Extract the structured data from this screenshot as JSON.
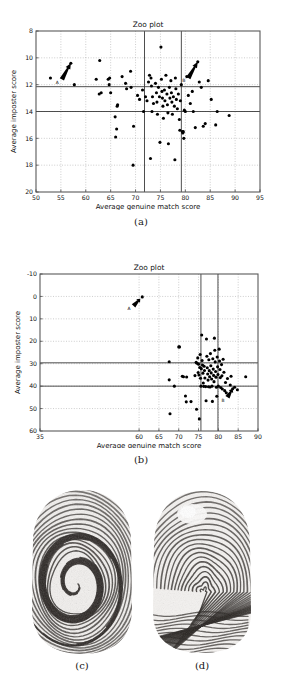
{
  "figure": {
    "panels": [
      {
        "id": "a",
        "caption": "(a)",
        "type": "scatter-zoo-plot"
      },
      {
        "id": "b",
        "caption": "(b)",
        "type": "scatter-zoo-plot"
      },
      {
        "id": "c",
        "caption": "(c)",
        "type": "fingerprint-image",
        "alt": "fingerprint-whorl"
      },
      {
        "id": "d",
        "caption": "(d)",
        "type": "fingerprint-image",
        "alt": "fingerprint-loop"
      }
    ]
  },
  "chart_data": [
    {
      "panel": "a",
      "type": "scatter",
      "title": "Zoo plot",
      "xlabel": "Average genuine match score",
      "ylabel": "Average imposter score",
      "xlim": [
        50,
        95
      ],
      "ylim": [
        8,
        20
      ],
      "y_inverted": true,
      "xticks": [
        50,
        55,
        60,
        65,
        70,
        75,
        80,
        85,
        90,
        95
      ],
      "yticks": [
        8,
        10,
        12,
        14,
        16,
        18,
        20
      ],
      "grid": true,
      "legend": "none",
      "reference_lines": {
        "vertical": [
          71.8,
          79.2
        ],
        "horizontal": [
          12.15,
          14.0
        ]
      },
      "annotations": [
        {
          "label": "A",
          "arrow_from": [
            55.2,
            11.6
          ],
          "arrow_to": [
            57.0,
            10.4
          ]
        },
        {
          "label": "B",
          "arrow_from": [
            80.6,
            11.5
          ],
          "arrow_to": [
            82.5,
            10.3
          ]
        }
      ],
      "points": [
        [
          52.9,
          11.5
        ],
        [
          57.0,
          10.4
        ],
        [
          57.7,
          12.0
        ],
        [
          62.8,
          10.2
        ],
        [
          62.1,
          11.6
        ],
        [
          62.7,
          12.7
        ],
        [
          63.1,
          12.6
        ],
        [
          64.5,
          11.6
        ],
        [
          64.8,
          11.5
        ],
        [
          64.7,
          12.0
        ],
        [
          65.0,
          12.6
        ],
        [
          66.3,
          13.6
        ],
        [
          66.4,
          13.5
        ],
        [
          65.9,
          14.4
        ],
        [
          66.2,
          15.3
        ],
        [
          66.0,
          15.9
        ],
        [
          67.3,
          11.4
        ],
        [
          68.0,
          11.9
        ],
        [
          68.2,
          12.3
        ],
        [
          69.0,
          11.0
        ],
        [
          69.1,
          12.2
        ],
        [
          69.5,
          18.0
        ],
        [
          69.6,
          15.1
        ],
        [
          70.4,
          12.8
        ],
        [
          70.8,
          13.1
        ],
        [
          71.4,
          12.4
        ],
        [
          71.6,
          14.0
        ],
        [
          72.0,
          12.9
        ],
        [
          72.3,
          13.2
        ],
        [
          72.6,
          11.8
        ],
        [
          72.8,
          11.3
        ],
        [
          73.1,
          11.5
        ],
        [
          73.2,
          12.1
        ],
        [
          73.4,
          12.9
        ],
        [
          73.6,
          13.4
        ],
        [
          73.0,
          17.5
        ],
        [
          73.3,
          14.0
        ],
        [
          74.0,
          11.9
        ],
        [
          74.2,
          12.6
        ],
        [
          74.3,
          13.3
        ],
        [
          74.4,
          14.2
        ],
        [
          74.6,
          12.2
        ],
        [
          74.8,
          12.9
        ],
        [
          74.9,
          16.3
        ],
        [
          75.1,
          9.2
        ],
        [
          75.2,
          11.6
        ],
        [
          75.3,
          12.5
        ],
        [
          75.4,
          13.0
        ],
        [
          75.5,
          13.6
        ],
        [
          75.6,
          14.5
        ],
        [
          75.8,
          12.4
        ],
        [
          75.9,
          13.2
        ],
        [
          76.1,
          11.3
        ],
        [
          76.3,
          12.7
        ],
        [
          76.4,
          13.5
        ],
        [
          76.5,
          14.1
        ],
        [
          76.6,
          16.4
        ],
        [
          76.8,
          12.2
        ],
        [
          76.9,
          13.0
        ],
        [
          77.1,
          11.7
        ],
        [
          77.2,
          12.6
        ],
        [
          77.3,
          13.3
        ],
        [
          77.4,
          14.2
        ],
        [
          77.6,
          12.9
        ],
        [
          77.8,
          13.6
        ],
        [
          77.9,
          17.6
        ],
        [
          78.0,
          11.5
        ],
        [
          78.1,
          12.3
        ],
        [
          78.2,
          13.1
        ],
        [
          78.4,
          13.8
        ],
        [
          78.6,
          12.7
        ],
        [
          78.8,
          14.6
        ],
        [
          78.9,
          15.4
        ],
        [
          79.0,
          13.2
        ],
        [
          79.2,
          12.0
        ],
        [
          79.4,
          15.5
        ],
        [
          79.5,
          15.6
        ],
        [
          79.6,
          15.5
        ],
        [
          79.7,
          16.0
        ],
        [
          79.8,
          13.9
        ],
        [
          80.0,
          14.0
        ],
        [
          80.3,
          11.4
        ],
        [
          80.6,
          12.8
        ],
        [
          81.0,
          13.4
        ],
        [
          81.4,
          12.5
        ],
        [
          81.6,
          14.0
        ],
        [
          82.0,
          15.2
        ],
        [
          82.5,
          10.3
        ],
        [
          82.8,
          11.8
        ],
        [
          83.2,
          12.2
        ],
        [
          83.6,
          15.1
        ],
        [
          84.0,
          14.9
        ],
        [
          84.6,
          11.7
        ],
        [
          85.2,
          13.1
        ],
        [
          86.1,
          15.0
        ],
        [
          86.4,
          14.0
        ],
        [
          88.8,
          14.3
        ]
      ]
    },
    {
      "panel": "b",
      "type": "scatter",
      "title": "Zoo plot",
      "xlabel": "Average genuine match score",
      "ylabel": "Average imposter score",
      "xlim": [
        35,
        90
      ],
      "ylim": [
        -10,
        60
      ],
      "y_inverted": true,
      "xticks": [
        35,
        60,
        65,
        70,
        75,
        80,
        85,
        90
      ],
      "xtick_labels": [
        "35",
        "60",
        "65",
        "70",
        "75",
        "80",
        "85",
        "90"
      ],
      "yticks": [
        -10,
        0,
        10,
        20,
        30,
        40,
        50,
        60
      ],
      "grid": true,
      "legend": "none",
      "reference_lines": {
        "vertical": [
          75.6,
          79.9
        ],
        "horizontal": [
          29.6,
          40.0
        ]
      },
      "annotations": [
        {
          "label": "A",
          "arrow_from": [
            58.6,
            4.2
          ],
          "arrow_to": [
            60.3,
            1.0
          ]
        },
        {
          "label": "B",
          "arrow_from": [
            82.3,
            45.0
          ],
          "arrow_to": [
            83.6,
            41.2
          ]
        }
      ],
      "points": [
        [
          60.8,
          0.2
        ],
        [
          67.6,
          29.1
        ],
        [
          67.6,
          37.2
        ],
        [
          67.8,
          52.3
        ],
        [
          68.9,
          40.0
        ],
        [
          70.0,
          22.5
        ],
        [
          70.2,
          22.5
        ],
        [
          70.9,
          35.6
        ],
        [
          71.2,
          35.8
        ],
        [
          71.7,
          44.4
        ],
        [
          71.9,
          47.0
        ],
        [
          72.0,
          35.9
        ],
        [
          73.1,
          46.9
        ],
        [
          74.1,
          35.3
        ],
        [
          74.4,
          29.4
        ],
        [
          74.5,
          50.3
        ],
        [
          74.6,
          29.8
        ],
        [
          74.8,
          27.4
        ],
        [
          74.9,
          33.9
        ],
        [
          75.0,
          30.2
        ],
        [
          75.1,
          35.0
        ],
        [
          75.2,
          54.6
        ],
        [
          75.3,
          31.7
        ],
        [
          75.4,
          25.9
        ],
        [
          75.5,
          36.5
        ],
        [
          75.6,
          40.0
        ],
        [
          75.7,
          32.2
        ],
        [
          75.8,
          17.2
        ],
        [
          75.9,
          28.6
        ],
        [
          76.0,
          30.6
        ],
        [
          76.1,
          34.2
        ],
        [
          76.2,
          38.6
        ],
        [
          76.3,
          40.1
        ],
        [
          76.4,
          31.1
        ],
        [
          76.5,
          33.0
        ],
        [
          76.6,
          36.4
        ],
        [
          76.8,
          40.2
        ],
        [
          76.9,
          46.5
        ],
        [
          77.0,
          19.0
        ],
        [
          77.1,
          26.7
        ],
        [
          77.2,
          31.8
        ],
        [
          77.3,
          34.6
        ],
        [
          77.4,
          37.3
        ],
        [
          77.5,
          40.3
        ],
        [
          77.6,
          28.2
        ],
        [
          77.7,
          33.1
        ],
        [
          77.8,
          35.8
        ],
        [
          77.9,
          40.4
        ],
        [
          78.0,
          25.5
        ],
        [
          78.1,
          30.9
        ],
        [
          78.2,
          34.1
        ],
        [
          78.3,
          36.8
        ],
        [
          78.4,
          40.0
        ],
        [
          78.5,
          46.8
        ],
        [
          78.6,
          27.8
        ],
        [
          78.7,
          32.4
        ],
        [
          78.8,
          35.2
        ],
        [
          78.9,
          38.0
        ],
        [
          79.0,
          18.6
        ],
        [
          79.1,
          24.0
        ],
        [
          79.2,
          29.2
        ],
        [
          79.3,
          33.5
        ],
        [
          79.4,
          36.0
        ],
        [
          79.5,
          40.5
        ],
        [
          79.6,
          44.5
        ],
        [
          79.7,
          27.0
        ],
        [
          79.8,
          31.4
        ],
        [
          79.9,
          34.8
        ],
        [
          80.0,
          40.0
        ],
        [
          80.2,
          23.5
        ],
        [
          80.3,
          28.8
        ],
        [
          80.4,
          32.6
        ],
        [
          80.5,
          36.2
        ],
        [
          80.6,
          40.6
        ],
        [
          80.8,
          30.4
        ],
        [
          80.9,
          35.4
        ],
        [
          81.0,
          41.3
        ],
        [
          81.2,
          28.0
        ],
        [
          81.4,
          33.8
        ],
        [
          81.6,
          42.0
        ],
        [
          81.8,
          38.4
        ],
        [
          82.0,
          43.0
        ],
        [
          82.3,
          36.6
        ],
        [
          82.6,
          44.0
        ],
        [
          83.0,
          39.5
        ],
        [
          83.2,
          35.6
        ],
        [
          83.6,
          41.2
        ],
        [
          84.1,
          40.5
        ],
        [
          84.8,
          41.6
        ],
        [
          86.9,
          35.8
        ]
      ]
    }
  ]
}
